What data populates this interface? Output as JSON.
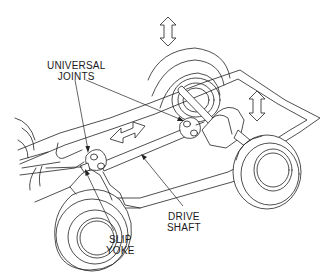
{
  "diagram": {
    "type": "technical-line-illustration",
    "colors": {
      "background": "#ffffff",
      "line": "#222222",
      "text": "#1a1a1a"
    },
    "labels": {
      "universal_joints": {
        "line1": "UNIVERSAL",
        "line2": "JOINTS"
      },
      "drive_shaft": {
        "line1": "DRIVE",
        "line2": "SHAFT"
      },
      "slip_yoke": {
        "line1": "SLIP",
        "line2": "YOKE"
      }
    },
    "motion_indicators": [
      {
        "name": "rear-wheel-vertical-travel",
        "direction": "vertical"
      },
      {
        "name": "axle-vertical-travel",
        "direction": "vertical"
      },
      {
        "name": "drive-shaft-length-change",
        "direction": "horizontal"
      }
    ],
    "components": [
      "frame",
      "front-wheel",
      "rear-left-wheel",
      "rear-right-wheel",
      "rear-axle",
      "differential",
      "front-universal-joint",
      "rear-universal-joint",
      "slip-yoke",
      "drive-shaft"
    ]
  }
}
